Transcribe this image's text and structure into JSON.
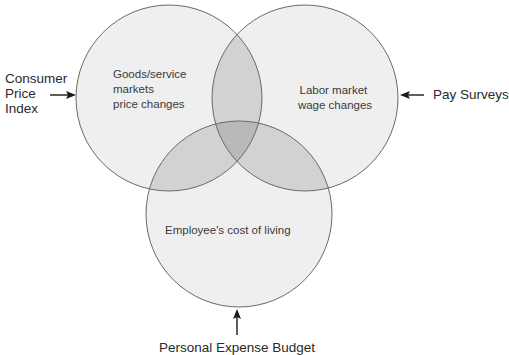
{
  "diagram": {
    "type": "venn",
    "colors": {
      "circle_fill": "#efefef",
      "circle_stroke": "#6a6a6a",
      "overlap2_fill": "#d2d2d2",
      "overlap3_fill": "#b9b9b9",
      "arrow": "#1a1a1a",
      "text": "#333333"
    },
    "circles": [
      {
        "id": "goods",
        "lines": [
          "Goods/service",
          "markets",
          "price changes"
        ]
      },
      {
        "id": "labor",
        "lines": [
          "Labor market",
          "wage changes"
        ]
      },
      {
        "id": "cost",
        "lines": [
          "Employee's cost of living"
        ]
      }
    ],
    "sources": [
      {
        "id": "cpi",
        "lines": [
          "Consumer",
          "Price",
          "Index"
        ],
        "arrow": "right-arrow-icon"
      },
      {
        "id": "pay",
        "lines": [
          "Pay Surveys"
        ],
        "arrow": "left-arrow-icon"
      },
      {
        "id": "budget",
        "lines": [
          "Personal Expense Budget"
        ],
        "arrow": "up-arrow-icon"
      }
    ]
  }
}
